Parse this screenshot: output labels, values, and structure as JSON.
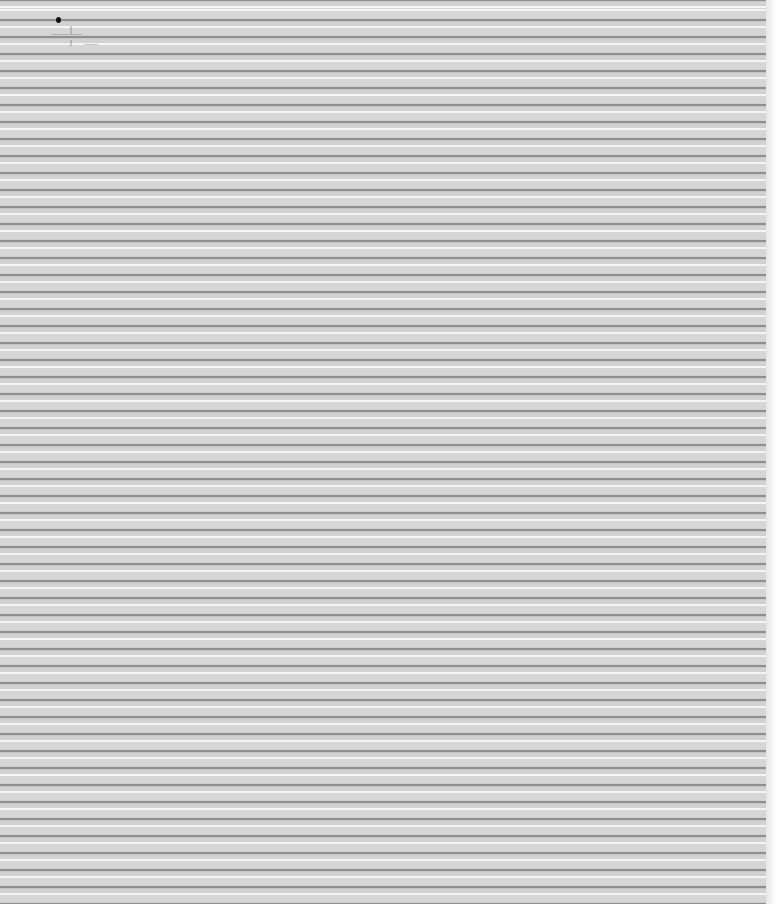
{
  "page": {
    "stripe_period_px": 17,
    "colors": {
      "highlight": "#f4f4f4",
      "base": "#d4d4d4",
      "line": "#8f8f8f",
      "margin": "#ffffff"
    }
  },
  "marks": [
    {
      "type": "dot",
      "color": "#111111"
    },
    {
      "type": "faint-smudge"
    }
  ]
}
